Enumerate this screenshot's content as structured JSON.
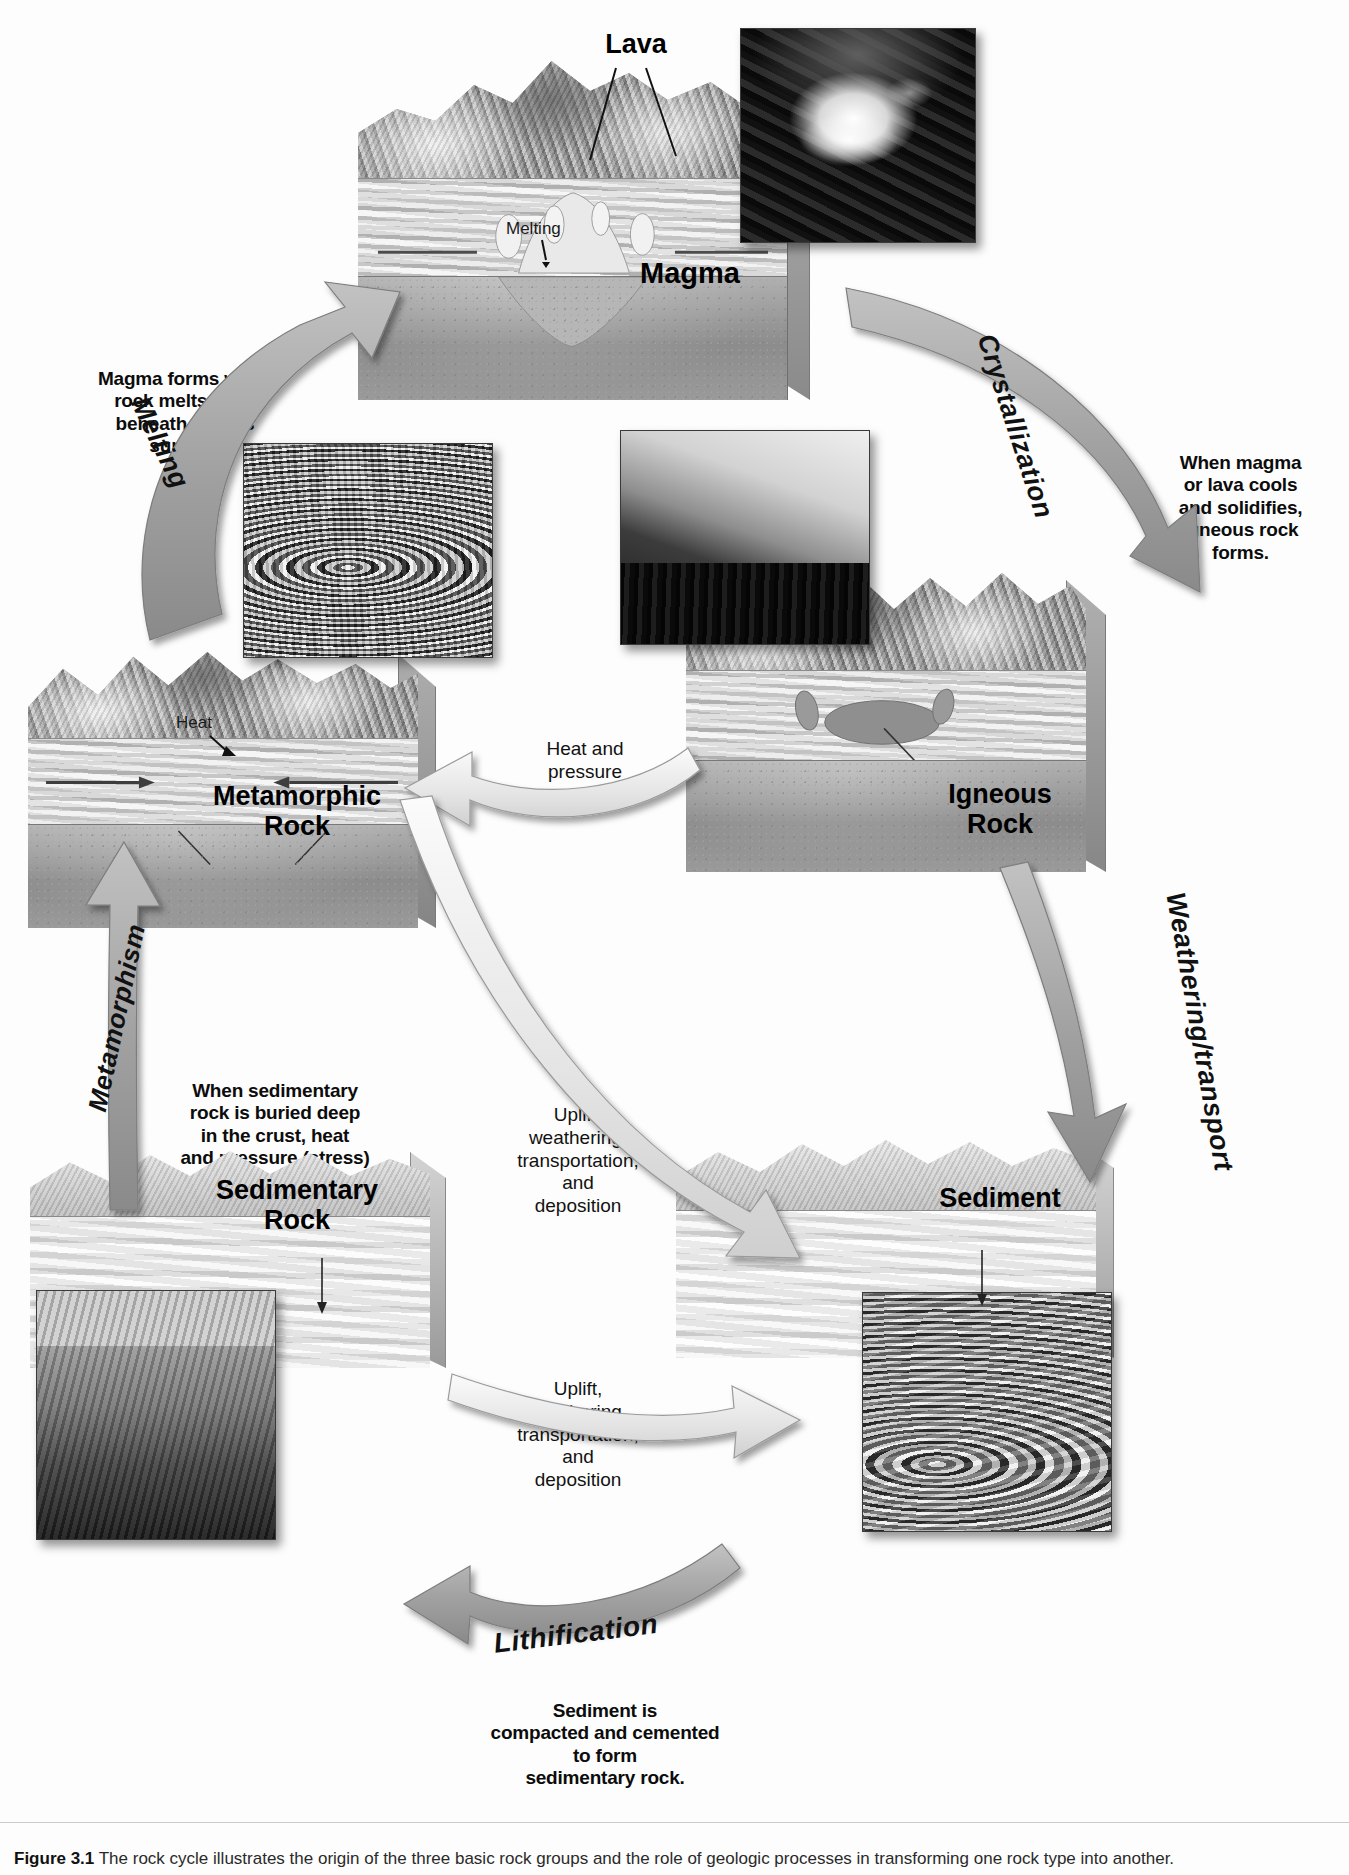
{
  "figure": {
    "number": "Figure 3.1",
    "caption": "The rock cycle illustrates the origin of the three basic rock groups and the role of geologic processes in transforming one rock type into another."
  },
  "blocks": [
    {
      "id": "magma",
      "label": "Magma",
      "sublabels": [
        "Lava",
        "Melting"
      ]
    },
    {
      "id": "igneous",
      "label": "Igneous\nRock",
      "sublabels": []
    },
    {
      "id": "metamorphic",
      "label": "Metamorphic\nRock",
      "sublabels": [
        "Heat"
      ]
    },
    {
      "id": "sedimentary",
      "label": "Sedimentary\nRock",
      "sublabels": []
    },
    {
      "id": "sediment",
      "label": "Sediment",
      "sublabels": []
    }
  ],
  "arrow_labels": [
    {
      "id": "melting",
      "text": "Melting"
    },
    {
      "id": "crystallization",
      "text": "Crystallization"
    },
    {
      "id": "weathering",
      "text": "Weathering/transport"
    },
    {
      "id": "metamorphism",
      "text": "Metamorphism"
    },
    {
      "id": "lithification",
      "text": "Lithification"
    }
  ],
  "captions": [
    {
      "id": "magma-forms",
      "text": "Magma forms when\nrock melts deep\nbeneath Earth's\nsurface."
    },
    {
      "id": "igneous-forms",
      "text": "When magma\nor lava cools\nand solidifies,\nigneous rock\nforms."
    },
    {
      "id": "metamorphic-forms",
      "text": "When sedimentary\nrock is buried deep\nin the crust, heat\nand pressure (stress)\ncause it to become\nmetamorphic\nrock."
    },
    {
      "id": "weathering-desc",
      "text": "Weathering breaks\ndown rock that is\ntransported and\ndeposited as\nsediment."
    },
    {
      "id": "lithification-desc",
      "text": "Sediment is\ncompacted and cemented\nto form\nsedimentary rock."
    }
  ],
  "process_labels": [
    {
      "id": "heat-and-pressure",
      "text": "Heat and\npressure"
    },
    {
      "id": "uplift-upper",
      "text": "Uplift,\nweathering,\ntransportation,\nand\ndeposition"
    },
    {
      "id": "uplift-lower",
      "text": "Uplift,\nweathering,\ntransportation,\nand\ndeposition"
    }
  ],
  "inset_photos": [
    {
      "id": "lava-photo",
      "alt": "lava fountain erupting"
    },
    {
      "id": "folded-rock-photo",
      "alt": "folded metamorphic rock layers"
    },
    {
      "id": "granite-dome-photo",
      "alt": "granite dome with conifer forest"
    },
    {
      "id": "canyon-photo",
      "alt": "layered sedimentary canyon wall"
    },
    {
      "id": "sand-dunes-photo",
      "alt": "rippled sand deposits"
    }
  ],
  "colors": {
    "arrow_gray": "#a8a8a8",
    "arrow_light": "#e8e8e8",
    "text": "#0c0c0c"
  }
}
